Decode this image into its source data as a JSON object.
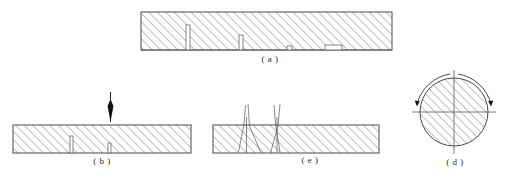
{
  "figure": {
    "background": "#ffffff",
    "line_color": "#4a4a4a",
    "hatch_color": "#8d8d8d",
    "arrow_color": "#111111"
  },
  "panels": [
    {
      "id": "a",
      "caption": "( a )",
      "shape": "hatched-rectangle",
      "x": 141,
      "y": 12,
      "width": 251,
      "height": 38,
      "caption_x": 240,
      "caption_y": 54,
      "caption_width": 60,
      "features": [
        {
          "name": "surface-flaw-1",
          "type": "vertical-slot",
          "x": 45,
          "width": 4,
          "height": 25
        },
        {
          "name": "surface-flaw-2",
          "type": "vertical-slot",
          "x": 98,
          "width": 4,
          "height": 15
        },
        {
          "name": "surface-flaw-3",
          "type": "shallow-notch",
          "x": 146,
          "width": 5,
          "height": 4
        },
        {
          "name": "surface-flaw-4",
          "type": "flat-notch",
          "x": 184,
          "width": 17,
          "height": 5
        }
      ]
    },
    {
      "id": "b",
      "caption": "( b )",
      "shape": "hatched-rectangle",
      "x": 13,
      "y": 125,
      "width": 178,
      "height": 28,
      "caption_x": 72,
      "caption_y": 156,
      "caption_width": 60,
      "load_arrow": {
        "name": "downward-load-arrow",
        "x": 110,
        "top_y": 92,
        "tip_y": 122
      },
      "features": [
        {
          "name": "surface-flaw-1",
          "type": "vertical-slot",
          "x": 58,
          "width": 3,
          "height": 17
        },
        {
          "name": "surface-flaw-2",
          "type": "vertical-slot",
          "x": 96,
          "width": 3,
          "height": 10
        }
      ]
    },
    {
      "id": "c",
      "caption": "( e )",
      "shape": "hatched-rectangle",
      "x": 213,
      "y": 125,
      "width": 166,
      "height": 28,
      "caption_x": 280,
      "caption_y": 155,
      "caption_width": 60,
      "cracks": [
        {
          "name": "v-crack-left",
          "x": 247
        },
        {
          "name": "v-crack-right",
          "x": 277
        }
      ]
    },
    {
      "id": "d",
      "caption": "( d )",
      "shape": "hatched-circle",
      "cx": 454,
      "cy": 112,
      "r": 34,
      "caption_x": 425,
      "caption_y": 157,
      "caption_width": 60,
      "axes": {
        "name": "crosshair-axes",
        "overhang": 8
      },
      "rotation_arrows": [
        {
          "name": "rotation-arc-left",
          "side": "left"
        },
        {
          "name": "rotation-arc-right",
          "side": "right"
        }
      ]
    }
  ]
}
